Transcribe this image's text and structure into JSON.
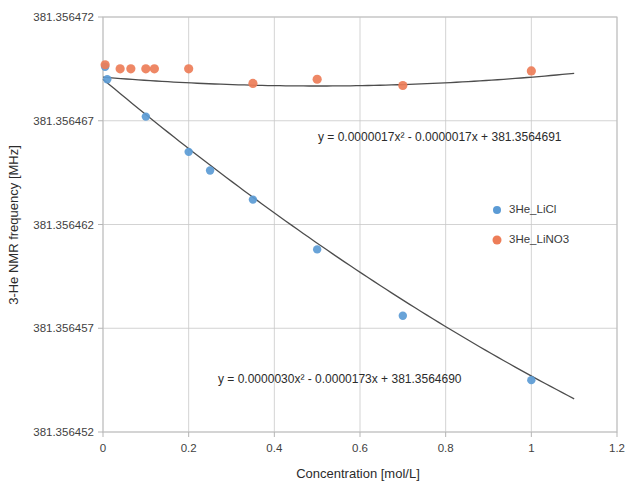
{
  "chart_data": {
    "type": "scatter",
    "title": "",
    "xlabel": "Concentration [mol/L]",
    "ylabel": "3-He NMR frequency [MHz]",
    "xlim": [
      0,
      1.2
    ],
    "ylim": [
      381.356452,
      381.356472
    ],
    "xticks": [
      "0",
      "0.2",
      "0.4",
      "0.6",
      "0.8",
      "1",
      "1.2"
    ],
    "xtick_values": [
      0,
      0.2,
      0.4,
      0.6,
      0.8,
      1,
      1.2
    ],
    "yticks": [
      "381.356452",
      "381.356457",
      "381.356462",
      "381.356467",
      "381.356472"
    ],
    "ytick_values": [
      381.356452,
      381.356457,
      381.356462,
      381.356467,
      381.356472
    ],
    "grid": true,
    "legend_position": "right",
    "series": [
      {
        "name": "3He_LiCl",
        "color": "#5B9BD5",
        "x": [
          0.005,
          0.01,
          0.1,
          0.2,
          0.25,
          0.35,
          0.5,
          0.7,
          1.0
        ],
        "y": [
          381.3564696,
          381.356469,
          381.3564672,
          381.3564655,
          381.3564646,
          381.3564632,
          381.3564608,
          381.3564576,
          381.3564545
        ],
        "trendline": "y = 0.0000030x² - 0.0000173x + 381.3564690"
      },
      {
        "name": "3He_LiNO3",
        "color": "#ED7D58",
        "x": [
          0.005,
          0.04,
          0.065,
          0.1,
          0.12,
          0.2,
          0.35,
          0.5,
          0.7,
          1.0
        ],
        "y": [
          381.3564697,
          381.3564695,
          381.3564695,
          381.3564695,
          381.3564695,
          381.3564695,
          381.3564688,
          381.356469,
          381.3564687,
          381.3564694
        ],
        "trendline": "y = 0.0000017x² - 0.0000017x + 381.3564691"
      }
    ],
    "annotations": [
      {
        "id": "eq-top",
        "text": "y = 0.0000017x² - 0.0000017x + 381.3564691"
      },
      {
        "id": "eq-bottom",
        "text": "y = 0.0000030x² - 0.0000173x + 381.3564690"
      }
    ]
  },
  "legend": {
    "items": [
      {
        "label": "3He_LiCl",
        "color": "#5B9BD5"
      },
      {
        "label": "3He_LiNO3",
        "color": "#ED7D58"
      }
    ]
  }
}
